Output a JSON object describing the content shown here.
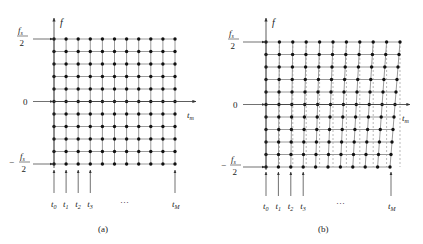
{
  "panels": [
    {
      "id": "a",
      "caption": "(a)",
      "y_axis_label": "f",
      "x_axis_label": "t",
      "x_axis_sub": "m",
      "freq_labels": {
        "top_num": "f",
        "top_num_sub": "s",
        "top_den": "2",
        "zero": "0",
        "bottom_sign": "−",
        "bottom_num": "f",
        "bottom_num_sub": "s",
        "bottom_den": "2"
      },
      "time_labels": [
        {
          "t": "t",
          "sub": "0"
        },
        {
          "t": "t",
          "sub": "1"
        },
        {
          "t": "t",
          "sub": "2"
        },
        {
          "t": "t",
          "sub": "3"
        },
        {
          "t": "t",
          "sub": "M"
        }
      ],
      "ellipsis": "···",
      "grid": {
        "rows": 11,
        "cols": 11,
        "type": "rectangular"
      }
    },
    {
      "id": "b",
      "caption": "(b)",
      "y_axis_label": "f",
      "x_axis_label": "t",
      "x_axis_sub": "m",
      "freq_labels": {
        "top_num": "f",
        "top_num_sub": "s",
        "top_den": "2",
        "zero": "0",
        "bottom_sign": "−",
        "bottom_num": "f",
        "bottom_num_sub": "s",
        "bottom_den": "2"
      },
      "time_labels": [
        {
          "t": "t",
          "sub": "0"
        },
        {
          "t": "t",
          "sub": "1"
        },
        {
          "t": "t",
          "sub": "2"
        },
        {
          "t": "t",
          "sub": "3"
        },
        {
          "t": "t",
          "sub": "M"
        }
      ],
      "ellipsis": "···",
      "grid": {
        "rows": 11,
        "cols": 11,
        "type": "skewed",
        "dashed_reference_lines": true
      }
    }
  ],
  "colors": {
    "line": "#9a9a9a",
    "dot": "#111111",
    "arrow": "#333333",
    "dash": "#8a8a8a"
  }
}
